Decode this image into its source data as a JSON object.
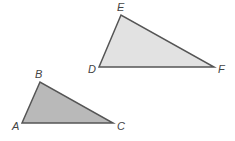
{
  "diagram": {
    "triangles": [
      {
        "name": "DEF",
        "fill": "#e2e2e2",
        "stroke": "#555555",
        "vertices": [
          {
            "label": "D",
            "x": 99,
            "y": 67,
            "lx": 88,
            "ly": 73
          },
          {
            "label": "E",
            "x": 121,
            "y": 15,
            "lx": 117,
            "ly": 11
          },
          {
            "label": "F",
            "x": 214,
            "y": 67,
            "lx": 218,
            "ly": 73
          }
        ]
      },
      {
        "name": "ABC",
        "fill": "#b9b9b9",
        "stroke": "#555555",
        "vertices": [
          {
            "label": "A",
            "x": 22,
            "y": 123,
            "lx": 12,
            "ly": 130
          },
          {
            "label": "B",
            "x": 40,
            "y": 82,
            "lx": 35,
            "ly": 78
          },
          {
            "label": "C",
            "x": 113,
            "y": 123,
            "lx": 117,
            "ly": 130
          }
        ]
      }
    ]
  }
}
